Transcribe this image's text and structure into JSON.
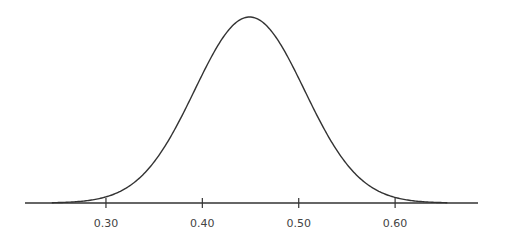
{
  "chart_data": {
    "type": "line",
    "title": "",
    "xlabel": "",
    "ylabel": "",
    "distribution": {
      "mean": 0.449,
      "sd": 0.057
    },
    "x_ticks": [
      0.3,
      0.4,
      0.5,
      0.6
    ],
    "x_tick_labels": [
      "0.30",
      "0.40",
      "0.50",
      "0.60"
    ],
    "xlim": [
      0.216,
      0.686
    ],
    "grid": false,
    "legend": null,
    "y_axis_visible": false
  },
  "colors": {
    "curve": "#333333",
    "axis": "#333333",
    "label": "#444444"
  }
}
